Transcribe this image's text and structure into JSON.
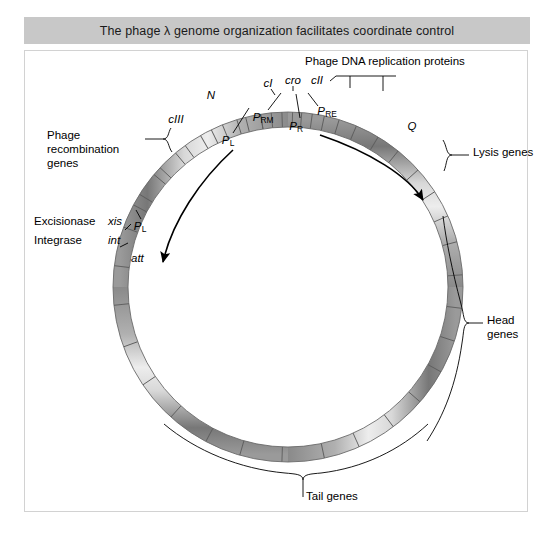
{
  "title": "The phage λ genome organization facilitates coordinate control",
  "colors": {
    "title_bar": "#c8c8c8",
    "panel_border": "#d2d2d2",
    "tube_light": "#e8e8e8",
    "tube_mid": "#a8a8a8",
    "tube_dark": "#6e6e6e",
    "line": "#000000",
    "background": "#ffffff"
  },
  "diagram": {
    "type": "circular-genome-map",
    "organism": "phage λ",
    "center": [
      288,
      287
    ],
    "radius": 167,
    "tube_width": 15
  },
  "gene_labels": [
    {
      "name": "cIII",
      "text": "cIII",
      "italic": true,
      "x": 176,
      "y": 120,
      "align": "center"
    },
    {
      "name": "N",
      "text": "N",
      "italic": true,
      "x": 211,
      "y": 96,
      "align": "center"
    },
    {
      "name": "cI",
      "text": "cI",
      "italic": true,
      "x": 268,
      "y": 84,
      "align": "center"
    },
    {
      "name": "cro",
      "text": "cro",
      "italic": true,
      "x": 293,
      "y": 81,
      "align": "center"
    },
    {
      "name": "cII",
      "text": "cII",
      "italic": true,
      "x": 316,
      "y": 81,
      "align": "center"
    },
    {
      "name": "Q",
      "text": "Q",
      "italic": true,
      "x": 412,
      "y": 127,
      "align": "center"
    },
    {
      "name": "xis",
      "text": "xis",
      "italic": true,
      "x": 110,
      "y": 221,
      "align": "left"
    },
    {
      "name": "int",
      "text": "int",
      "italic": true,
      "x": 110,
      "y": 240,
      "align": "left"
    },
    {
      "name": "att",
      "text": "att",
      "italic": true,
      "x": 132,
      "y": 258,
      "align": "left"
    }
  ],
  "promoter_labels": [
    {
      "name": "PL-upper",
      "base": "P",
      "sub": "L",
      "x": 228,
      "y": 141,
      "align": "center"
    },
    {
      "name": "PL-lower",
      "base": "P",
      "sub": "L",
      "x": 140,
      "y": 227,
      "align": "center"
    },
    {
      "name": "PRM",
      "base": "P",
      "sub": "RM",
      "x": 263,
      "y": 118,
      "align": "center"
    },
    {
      "name": "PR",
      "base": "P",
      "sub": "R",
      "x": 296,
      "y": 127,
      "align": "center"
    },
    {
      "name": "PRE",
      "base": "P",
      "sub": "RE",
      "x": 325,
      "y": 112,
      "align": "center"
    }
  ],
  "region_labels": [
    {
      "name": "phage-dna-replication-proteins",
      "lines": [
        "Phage DNA replication proteins"
      ],
      "x": 305,
      "y": 62,
      "align": "left"
    },
    {
      "name": "phage-recombination-genes",
      "lines": [
        "Phage",
        "recombination",
        "genes"
      ],
      "x": 47,
      "y": 135,
      "align": "left"
    },
    {
      "name": "excisionase",
      "lines": [
        "Excisionase"
      ],
      "x": 34,
      "y": 221,
      "align": "left"
    },
    {
      "name": "integrase",
      "lines": [
        "Integrase"
      ],
      "x": 34,
      "y": 240,
      "align": "left"
    },
    {
      "name": "lysis-genes",
      "lines": [
        "Lysis genes"
      ],
      "x": 473,
      "y": 152,
      "align": "left"
    },
    {
      "name": "head-genes",
      "lines": [
        "Head",
        "genes"
      ],
      "x": 487,
      "y": 320,
      "align": "left"
    },
    {
      "name": "tail-genes",
      "lines": [
        "Tail genes"
      ],
      "x": 306,
      "y": 495,
      "align": "left"
    }
  ],
  "transcription_arrows": [
    {
      "name": "leftward-transcript",
      "from": "P_L",
      "to": "att",
      "direction": "counterclockwise"
    },
    {
      "name": "rightward-transcript",
      "from": "P_R",
      "to": "Q",
      "direction": "clockwise"
    }
  ]
}
